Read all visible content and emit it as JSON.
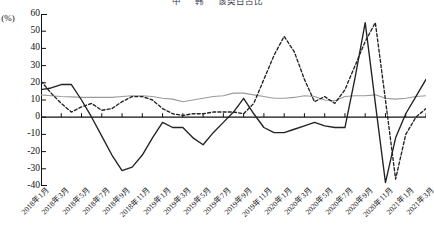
{
  "legend": {
    "items": [
      {
        "label": "中",
        "style": "solid-black"
      },
      {
        "label": "韩",
        "style": "dashed-black"
      },
      {
        "label": "该类目占比",
        "style": "solid-gray"
      }
    ]
  },
  "axes": {
    "ylabel": "(%)",
    "yticks": [
      60,
      50,
      40,
      30,
      20,
      10,
      0,
      -10,
      -20,
      -30,
      -40
    ],
    "ylim": [
      -40,
      60
    ]
  },
  "colors": {
    "series_solid": "#222222",
    "series_dashed": "#222222",
    "series_gray": "#9a9a9a",
    "axis": "#111111"
  },
  "chart_data": {
    "type": "line",
    "title": "",
    "xlabel": "",
    "ylabel": "(%)",
    "ylim": [
      -40,
      60
    ],
    "grid": false,
    "legend_position": "top",
    "x": [
      "2018年1月",
      "2018年2月",
      "2018年3月",
      "2018年4月",
      "2018年5月",
      "2018年6月",
      "2018年7月",
      "2018年8月",
      "2018年9月",
      "2018年10月",
      "2018年11月",
      "2018年12月",
      "2019年1月",
      "2019年2月",
      "2019年3月",
      "2019年4月",
      "2019年5月",
      "2019年6月",
      "2019年7月",
      "2019年8月",
      "2019年9月",
      "2019年10月",
      "2019年11月",
      "2019年12月",
      "2020年1月",
      "2020年2月",
      "2020年3月",
      "2020年4月",
      "2020年5月",
      "2020年6月",
      "2020年7月",
      "2020年8月",
      "2020年9月",
      "2020年10月",
      "2020年11月",
      "2020年12月",
      "2021年1月",
      "2021年2月",
      "2021年3月"
    ],
    "xticklabels": [
      "2018年1月",
      "2018年3月",
      "2018年5月",
      "2018年7月",
      "2018年9月",
      "2018年11月",
      "2019年1月",
      "2019年3月",
      "2019年5月",
      "2019年7月",
      "2019年9月",
      "2019年11月",
      "2020年1月",
      "2020年3月",
      "2020年5月",
      "2020年7月",
      "2020年9月",
      "2020年11月",
      "2021年1月",
      "2021年3月"
    ],
    "xtick_every": 2,
    "series": [
      {
        "name": "中",
        "style": "solid",
        "color": "#222222",
        "values": [
          16,
          17,
          19,
          19,
          10,
          0,
          -11,
          -22,
          -31,
          -29,
          -22,
          -12,
          -3,
          -6,
          -6,
          -12,
          -16,
          -9,
          -3,
          3,
          11,
          2,
          -6,
          -9,
          -9,
          -7,
          -5,
          -3,
          -5,
          -6,
          -6,
          23,
          55,
          8,
          -38,
          -12,
          2,
          12,
          22
        ]
      },
      {
        "name": "韩",
        "style": "dashed",
        "color": "#222222",
        "values": [
          21,
          14,
          8,
          3,
          6,
          8,
          4,
          5,
          9,
          12,
          12,
          10,
          5,
          2,
          1,
          2,
          2,
          3,
          3,
          3,
          2,
          8,
          22,
          36,
          47,
          38,
          22,
          9,
          12,
          8,
          16,
          30,
          44,
          55,
          10,
          -36,
          -10,
          0,
          5
        ]
      },
      {
        "name": "该类目占比",
        "style": "solid",
        "color": "#9a9a9a",
        "values": [
          13,
          12.5,
          12,
          11.8,
          11.5,
          11.5,
          11.5,
          11.5,
          12,
          12.5,
          12.5,
          12,
          11,
          10.5,
          9,
          10,
          11,
          12,
          12.5,
          14,
          14,
          13,
          12,
          11,
          11,
          11.5,
          12.5,
          12,
          10,
          9.5,
          12,
          12.5,
          12.5,
          13,
          11,
          10.5,
          11,
          12,
          12.5
        ]
      }
    ]
  }
}
